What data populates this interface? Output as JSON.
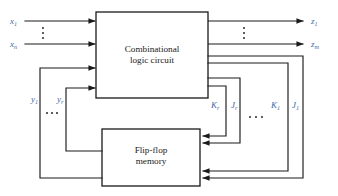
{
  "figure": {
    "kind": "block-diagram",
    "background_color": "#ffffff",
    "line_color": "#1a1a1a",
    "label_color": "#3f6aa8"
  },
  "blocks": {
    "combinational": {
      "line1": "Combinational",
      "line2": "logic circuit"
    },
    "memory": {
      "line1": "Flip-flop",
      "line2": "memory"
    }
  },
  "inputs": {
    "first": {
      "base": "x",
      "sub": "1"
    },
    "last": {
      "base": "x",
      "sub": "n"
    },
    "ellipsis": "⋮"
  },
  "outputs": {
    "first": {
      "base": "z",
      "sub": "1"
    },
    "last": {
      "base": "z",
      "sub": "m"
    },
    "ellipsis": "⋮"
  },
  "state_feedback": {
    "first": {
      "base": "y",
      "sub": "1"
    },
    "last": {
      "base": "y",
      "sub": "r"
    },
    "ellipsis": "⋯"
  },
  "excitation": {
    "k_r": {
      "base": "K",
      "sub": "r"
    },
    "j_r": {
      "base": "J",
      "sub": "r"
    },
    "k_1": {
      "base": "K",
      "sub": "1"
    },
    "j_1": {
      "base": "J",
      "sub": "1"
    },
    "ellipsis": "⋯"
  }
}
